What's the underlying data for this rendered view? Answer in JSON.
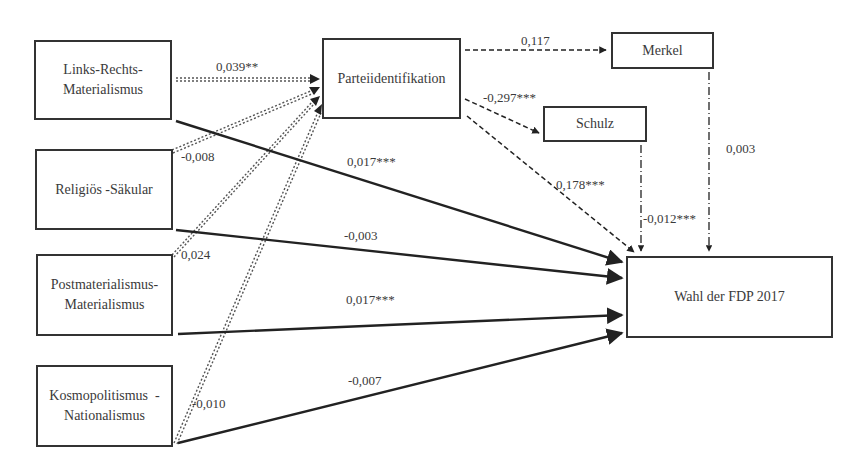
{
  "nodes": {
    "links_rechts": {
      "line1": "Links-Rechts-",
      "line2": "Materialismus"
    },
    "religioes": {
      "label": "Religiös -Säkular"
    },
    "postmat": {
      "line1": "Postmaterialismus-",
      "line2": "Materialismus"
    },
    "kosmo": {
      "line1": "Kosmopolitismus  -",
      "line2": "Nationalismus"
    },
    "partei": {
      "label": "Parteiidentifikation"
    },
    "merkel": {
      "label": "Merkel"
    },
    "schulz": {
      "label": "Schulz"
    },
    "wahl": {
      "label": "Wahl der FDP 2017"
    }
  },
  "edges": {
    "lr_partei": "0,039**",
    "rel_partei": "-0,008",
    "post_partei": "0,024",
    "kosmo_partei": "-0,010",
    "lr_wahl": "0,017***",
    "rel_wahl": "-0,003",
    "post_wahl": "0,017***",
    "kosmo_wahl": "-0,007",
    "partei_merkel": "0,117",
    "partei_schulz": "-0,297***",
    "partei_wahl": "0,178***",
    "schulz_wahl": "-0,012***",
    "merkel_wahl": "0,003"
  },
  "legend_styles": {
    "dotted_double": "predictor → Parteiidentifikation",
    "solid": "predictor → Wahl",
    "dashed": "Parteiidentifikation → candidates/Wahl",
    "dash_dot": "candidate → Wahl"
  },
  "colors": {
    "line": "#333333",
    "background": "#ffffff"
  }
}
